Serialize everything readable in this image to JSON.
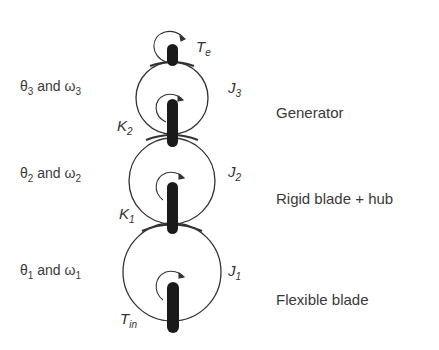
{
  "diagram": {
    "type": "three-mass drive-train model",
    "masses": [
      {
        "id": "J3",
        "inertia_symbol": "J",
        "inertia_sub": "3",
        "state_label": {
          "theta": "θ",
          "theta_sub": "3",
          "and": " and ",
          "omega": "ω",
          "omega_sub": "3"
        },
        "component": "Generator",
        "torque": {
          "symbol": "T",
          "sub": "e"
        }
      },
      {
        "id": "J2",
        "inertia_symbol": "J",
        "inertia_sub": "2",
        "state_label": {
          "theta": "θ",
          "theta_sub": "2",
          "and": " and ",
          "omega": "ω",
          "omega_sub": "2"
        },
        "component": "Rigid blade + hub"
      },
      {
        "id": "J1",
        "inertia_symbol": "J",
        "inertia_sub": "1",
        "state_label": {
          "theta": "θ",
          "theta_sub": "1",
          "and": " and ",
          "omega": "ω",
          "omega_sub": "1"
        },
        "component": "Flexible blade",
        "torque": {
          "symbol": "T",
          "sub": "in"
        }
      }
    ],
    "springs": [
      {
        "symbol": "K",
        "sub": "2"
      },
      {
        "symbol": "K",
        "sub": "1"
      }
    ],
    "colors": {
      "line": "#333333",
      "shaft": "#1a1a1a",
      "background": "#ffffff"
    }
  }
}
